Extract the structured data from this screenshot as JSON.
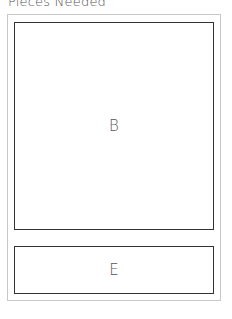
{
  "header": {
    "title": "Pieces Needed"
  },
  "pieces": [
    {
      "label": "B"
    },
    {
      "label": "E"
    }
  ]
}
